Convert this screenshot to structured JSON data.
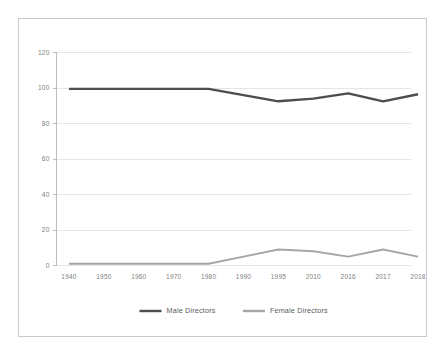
{
  "chart_data": {
    "type": "line",
    "title": "",
    "subtitle": "",
    "xlabel": "",
    "ylabel": "",
    "categories": [
      "1940",
      "1950",
      "1960",
      "1970",
      "1980",
      "1990",
      "1995",
      "2010",
      "2016",
      "2017",
      "2018"
    ],
    "ylim": [
      0,
      120
    ],
    "yticks": [
      0,
      20,
      40,
      60,
      80,
      100,
      120
    ],
    "ytick_labels": [
      "0",
      "20",
      "40",
      "60",
      "80",
      "100",
      "120"
    ],
    "grid": true,
    "grid_axis": "y",
    "legend_position": "bottom",
    "series": [
      {
        "name": "Male Directors",
        "color": "#4d4d4d",
        "values": [
          99.5,
          99.5,
          99.5,
          99.5,
          99.5,
          96,
          92.5,
          94,
          97,
          92.5,
          96.5
        ]
      },
      {
        "name": "Female Directors",
        "color": "#a6a6a6",
        "values": [
          1,
          1,
          1,
          1,
          1,
          5,
          9,
          8,
          5,
          9,
          5
        ]
      }
    ]
  },
  "legend": {
    "items": [
      {
        "label": "Male Directors",
        "color": "#4d4d4d"
      },
      {
        "label": "Female Directors",
        "color": "#a6a6a6"
      }
    ]
  },
  "colors": {
    "male": "#4d4d4d",
    "female": "#a6a6a6",
    "grid": "#e6e6e6",
    "axis": "#bdbdbd",
    "border": "#c9c9c9",
    "background": "#ffffff",
    "tick_text": "#808080",
    "legend_text": "#5a5a5a"
  }
}
